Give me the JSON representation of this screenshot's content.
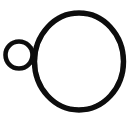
{
  "page": {
    "width": 128,
    "height": 117,
    "background_color": "#ffffff"
  },
  "drawing": {
    "type": "line-art",
    "description": "Hand-drawn black outline: one large circle with a smaller circle tangent to its upper-left side",
    "stroke_color": "#0d0d0d",
    "fill_color": "none",
    "shapes": [
      {
        "name": "large-circle",
        "kind": "circle",
        "center_x": 79,
        "center_y": 61.5,
        "radius": 44,
        "stroke_width": 5.4,
        "label": "large circle"
      },
      {
        "name": "small-circle",
        "kind": "circle",
        "center_x": 19,
        "center_y": 55,
        "radius": 13.5,
        "stroke_width": 4.6,
        "label": "small circle"
      }
    ]
  }
}
